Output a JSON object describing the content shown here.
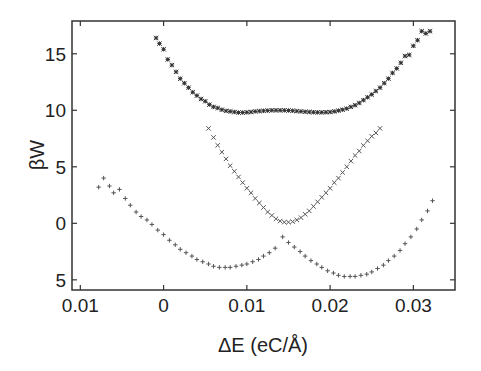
{
  "chart_data": {
    "type": "scatter",
    "title": "",
    "xlabel": "ΔE (eC/Å)",
    "ylabel": "βW",
    "xlim": [
      -0.011,
      0.035
    ],
    "ylim": [
      -5.9,
      17.9
    ],
    "x_ticks": [
      -0.01,
      0,
      0.01,
      0.02,
      0.03
    ],
    "x_tick_labels": [
      "0.01",
      "0",
      "0.01",
      "0.02",
      "0.03"
    ],
    "y_ticks": [
      15,
      10,
      5,
      0,
      -5
    ],
    "y_tick_labels": [
      "15",
      "10",
      "5",
      "0",
      "5"
    ],
    "grid": false,
    "legend": null,
    "series": [
      {
        "name": "top curve",
        "marker": "asterisk",
        "color": "#333333",
        "x": [
          -0.0009,
          -0.0005,
          0.0,
          0.0005,
          0.001,
          0.0015,
          0.002,
          0.0025,
          0.003,
          0.0035,
          0.004,
          0.0045,
          0.005,
          0.0055,
          0.006,
          0.0065,
          0.007,
          0.0075,
          0.008,
          0.0085,
          0.009,
          0.0095,
          0.01,
          0.0105,
          0.011,
          0.0115,
          0.012,
          0.0125,
          0.013,
          0.0135,
          0.014,
          0.0145,
          0.015,
          0.0155,
          0.016,
          0.0165,
          0.017,
          0.0175,
          0.018,
          0.0185,
          0.019,
          0.0195,
          0.02,
          0.0205,
          0.021,
          0.0215,
          0.022,
          0.0225,
          0.023,
          0.0235,
          0.024,
          0.0245,
          0.025,
          0.0255,
          0.026,
          0.0265,
          0.027,
          0.0275,
          0.028,
          0.0285,
          0.029,
          0.0295,
          0.03,
          0.0305,
          0.031,
          0.0315,
          0.032
        ],
        "y": [
          16.4,
          15.9,
          15.4,
          14.5,
          14.0,
          13.4,
          12.8,
          12.4,
          12.0,
          11.6,
          11.3,
          11.0,
          10.8,
          10.5,
          10.3,
          10.2,
          10.05,
          9.95,
          9.9,
          9.85,
          9.8,
          9.8,
          9.82,
          9.85,
          9.9,
          9.93,
          9.95,
          9.97,
          10.0,
          10.0,
          10.0,
          10.0,
          9.98,
          9.96,
          9.93,
          9.9,
          9.87,
          9.85,
          9.83,
          9.82,
          9.82,
          9.83,
          9.85,
          9.9,
          9.97,
          10.05,
          10.15,
          10.3,
          10.45,
          10.65,
          10.9,
          11.15,
          11.4,
          11.7,
          12.0,
          12.4,
          12.8,
          13.3,
          13.7,
          14.2,
          14.8,
          14.9,
          15.7,
          16.2,
          17.0,
          16.8,
          17.0
        ]
      },
      {
        "name": "middle curve",
        "marker": "x",
        "color": "#555555",
        "x": [
          0.0054,
          0.006,
          0.0065,
          0.007,
          0.0075,
          0.008,
          0.0085,
          0.009,
          0.0095,
          0.01,
          0.0105,
          0.011,
          0.0115,
          0.012,
          0.0125,
          0.013,
          0.0135,
          0.014,
          0.0145,
          0.015,
          0.0155,
          0.016,
          0.0165,
          0.017,
          0.0175,
          0.018,
          0.0185,
          0.019,
          0.0195,
          0.02,
          0.0205,
          0.021,
          0.0215,
          0.022,
          0.0225,
          0.023,
          0.0235,
          0.024,
          0.0245,
          0.025,
          0.0255,
          0.026
        ],
        "y": [
          8.4,
          7.6,
          6.9,
          6.3,
          5.7,
          5.1,
          4.6,
          4.1,
          3.6,
          3.1,
          2.7,
          2.2,
          1.8,
          1.4,
          1.0,
          0.7,
          0.4,
          0.2,
          0.1,
          0.1,
          0.15,
          0.3,
          0.5,
          0.8,
          1.1,
          1.5,
          1.9,
          2.3,
          2.7,
          3.1,
          3.6,
          4.0,
          4.5,
          5.0,
          5.5,
          6.0,
          6.4,
          6.9,
          7.3,
          7.7,
          8.0,
          8.4
        ]
      },
      {
        "name": "bottom curve",
        "marker": "plus",
        "color": "#555555",
        "x": [
          -0.0078,
          -0.0072,
          -0.0065,
          -0.006,
          -0.0053,
          -0.0046,
          -0.004,
          -0.0033,
          -0.0027,
          -0.002,
          -0.0014,
          -0.0007,
          0.0,
          0.0007,
          0.0014,
          0.002,
          0.0027,
          0.0034,
          0.004,
          0.0047,
          0.0054,
          0.006,
          0.0067,
          0.0074,
          0.008,
          0.0087,
          0.0094,
          0.01,
          0.0107,
          0.0114,
          0.012,
          0.0127,
          0.0134,
          0.0143,
          0.015,
          0.0157,
          0.0164,
          0.017,
          0.0177,
          0.0184,
          0.019,
          0.0197,
          0.0204,
          0.021,
          0.0217,
          0.0224,
          0.023,
          0.0237,
          0.0244,
          0.025,
          0.0257,
          0.0264,
          0.027,
          0.0277,
          0.0284,
          0.029,
          0.0297,
          0.0304,
          0.031,
          0.0317,
          0.0323
        ],
        "y": [
          3.2,
          4.0,
          3.3,
          2.7,
          3.0,
          2.2,
          1.6,
          1.0,
          0.6,
          0.3,
          -0.1,
          -0.6,
          -1.0,
          -1.5,
          -1.9,
          -2.3,
          -2.6,
          -2.9,
          -3.2,
          -3.4,
          -3.6,
          -3.8,
          -3.9,
          -3.9,
          -3.9,
          -3.8,
          -3.7,
          -3.6,
          -3.4,
          -3.2,
          -2.9,
          -2.6,
          -2.2,
          -1.2,
          -1.7,
          -2.1,
          -2.5,
          -2.9,
          -3.3,
          -3.6,
          -3.9,
          -4.2,
          -4.4,
          -4.6,
          -4.7,
          -4.7,
          -4.7,
          -4.6,
          -4.5,
          -4.3,
          -4.0,
          -3.7,
          -3.3,
          -2.9,
          -2.4,
          -1.8,
          -1.2,
          -0.5,
          0.3,
          1.1,
          2.0
        ]
      }
    ]
  }
}
